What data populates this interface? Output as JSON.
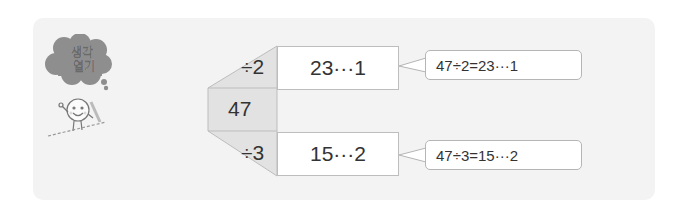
{
  "section_badge": {
    "line1": "생각",
    "line2": "열기",
    "icon": "thought-cloud-icon",
    "mascot": "smiling-character-icon"
  },
  "diagram": {
    "dividend": "47",
    "branches": [
      {
        "divisor_label": "÷2",
        "result": "23···1",
        "callout": "47÷2=23···1"
      },
      {
        "divisor_label": "÷3",
        "result": "15···2",
        "callout": "47÷3=15···2"
      }
    ]
  },
  "colors": {
    "panel_bg": "#f3f3f3",
    "shape_gray": "#e2e2e2",
    "border": "#bdbdbd",
    "cloud": "#8a8a8a",
    "text": "#333333"
  }
}
